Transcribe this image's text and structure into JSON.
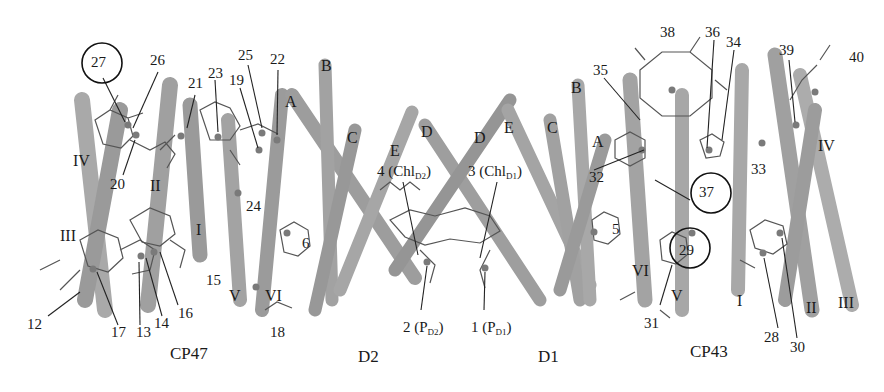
{
  "figure": {
    "type": "molecular-structure-diagram",
    "colors": {
      "helix": "#a8a8a8",
      "helix_shade": "#7d7d7d",
      "pigment": "#555555",
      "text": "#1a1a1a",
      "background": "#ffffff"
    }
  },
  "groups": [
    {
      "id": "cp47",
      "label": "CP47",
      "x": 170,
      "y": 345
    },
    {
      "id": "d2",
      "label": "D2",
      "x": 358,
      "y": 348
    },
    {
      "id": "d1",
      "label": "D1",
      "x": 538,
      "y": 348
    },
    {
      "id": "cp43",
      "label": "CP43",
      "x": 690,
      "y": 343
    }
  ],
  "helix_labels": [
    {
      "text": "IV",
      "x": 73,
      "y": 153
    },
    {
      "text": "II",
      "x": 150,
      "y": 178
    },
    {
      "text": "I",
      "x": 196,
      "y": 222
    },
    {
      "text": "III",
      "x": 60,
      "y": 228
    },
    {
      "text": "V",
      "x": 229,
      "y": 288
    },
    {
      "text": "VI",
      "x": 265,
      "y": 288
    },
    {
      "text": "A",
      "x": 285,
      "y": 94
    },
    {
      "text": "B",
      "x": 321,
      "y": 58
    },
    {
      "text": "C",
      "x": 347,
      "y": 130
    },
    {
      "text": "E",
      "x": 390,
      "y": 143
    },
    {
      "text": "D",
      "x": 421,
      "y": 124
    },
    {
      "text": "D",
      "x": 474,
      "y": 130
    },
    {
      "text": "E",
      "x": 504,
      "y": 120
    },
    {
      "text": "C",
      "x": 547,
      "y": 120
    },
    {
      "text": "B",
      "x": 571,
      "y": 80
    },
    {
      "text": "A",
      "x": 592,
      "y": 134
    },
    {
      "text": "IV",
      "x": 818,
      "y": 138
    },
    {
      "text": "VI",
      "x": 632,
      "y": 263
    },
    {
      "text": "V",
      "x": 671,
      "y": 288
    },
    {
      "text": "I",
      "x": 737,
      "y": 293
    },
    {
      "text": "II",
      "x": 806,
      "y": 300
    },
    {
      "text": "III",
      "x": 838,
      "y": 295
    }
  ],
  "pigment_labels": [
    {
      "text": "27",
      "x": 91,
      "y": 55,
      "circled": true
    },
    {
      "text": "26",
      "x": 150,
      "y": 53
    },
    {
      "text": "21",
      "x": 188,
      "y": 76
    },
    {
      "text": "23",
      "x": 208,
      "y": 66
    },
    {
      "text": "19",
      "x": 229,
      "y": 73
    },
    {
      "text": "25",
      "x": 238,
      "y": 48
    },
    {
      "text": "22",
      "x": 270,
      "y": 52
    },
    {
      "text": "20",
      "x": 110,
      "y": 177
    },
    {
      "text": "24",
      "x": 246,
      "y": 199
    },
    {
      "text": "6",
      "x": 302,
      "y": 236
    },
    {
      "text": "15",
      "x": 206,
      "y": 273
    },
    {
      "text": "16",
      "x": 178,
      "y": 306
    },
    {
      "text": "14",
      "x": 154,
      "y": 316
    },
    {
      "text": "13",
      "x": 136,
      "y": 325
    },
    {
      "text": "17",
      "x": 111,
      "y": 325
    },
    {
      "text": "12",
      "x": 27,
      "y": 317
    },
    {
      "text": "18",
      "x": 270,
      "y": 325
    },
    {
      "text": "4 (Chl<sub>D2</sub>)",
      "x": 377,
      "y": 164
    },
    {
      "text": "3 (Chl<sub>D1</sub>)",
      "x": 468,
      "y": 164
    },
    {
      "text": "2 (P<sub>D2</sub>)",
      "x": 403,
      "y": 320
    },
    {
      "text": "1 (P<sub>D1</sub>)",
      "x": 471,
      "y": 320
    },
    {
      "text": "5",
      "x": 612,
      "y": 222
    },
    {
      "text": "38",
      "x": 660,
      "y": 25
    },
    {
      "text": "36",
      "x": 705,
      "y": 25
    },
    {
      "text": "34",
      "x": 726,
      "y": 35
    },
    {
      "text": "35",
      "x": 593,
      "y": 63
    },
    {
      "text": "39",
      "x": 779,
      "y": 43
    },
    {
      "text": "40",
      "x": 849,
      "y": 50
    },
    {
      "text": "32",
      "x": 589,
      "y": 170
    },
    {
      "text": "33",
      "x": 751,
      "y": 162
    },
    {
      "text": "37",
      "x": 699,
      "y": 185,
      "circled": true
    },
    {
      "text": "29",
      "x": 679,
      "y": 243,
      "circled": true
    },
    {
      "text": "31",
      "x": 644,
      "y": 316
    },
    {
      "text": "28",
      "x": 764,
      "y": 330
    },
    {
      "text": "30",
      "x": 790,
      "y": 340
    }
  ]
}
